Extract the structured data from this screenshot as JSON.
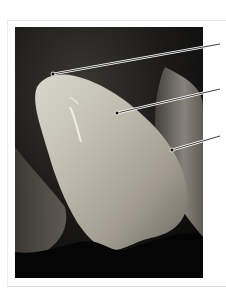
{
  "figure": {
    "frame_color": "#e6e6ea",
    "photo_background": "#0b0a09",
    "leader_line_color": "#2a2a2a",
    "leader_line_highlight": "#ffffff",
    "callouts": [
      {
        "id": "callout-1",
        "from": [
          53,
          74
        ],
        "to": [
          220,
          44
        ]
      },
      {
        "id": "callout-2",
        "from": [
          117,
          113
        ],
        "to": [
          220,
          89
        ]
      },
      {
        "id": "callout-3",
        "from": [
          172,
          150
        ],
        "to": [
          220,
          136
        ]
      }
    ]
  }
}
